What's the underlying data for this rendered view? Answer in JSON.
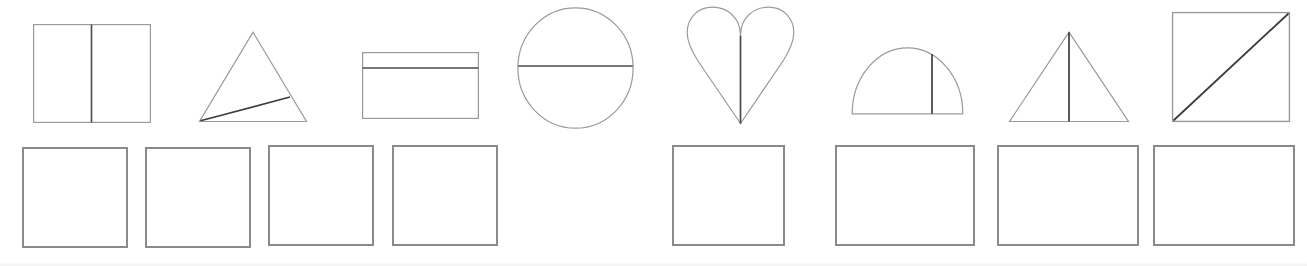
{
  "page": {
    "background_color": "#ffffff",
    "width": 1307,
    "height": 266,
    "outline_color": "#9a9a9a",
    "divider_color": "#4a4a4a",
    "answer_box_color": "#8a8a8a"
  },
  "rows": {
    "shapes_row": {
      "name": "shapes-row",
      "count": 8,
      "top": 0,
      "height": 135
    },
    "answers_row": {
      "name": "answer-boxes-row",
      "count": 8,
      "top": 140,
      "height": 120
    }
  },
  "shapes": [
    {
      "index": 1,
      "name": "square-split-vertical",
      "label": "square",
      "divider": "vertical-line",
      "equal_parts": "2",
      "x": 33,
      "y": 24,
      "width": 118,
      "height": 99
    },
    {
      "index": 2,
      "name": "triangle-split-diagonal",
      "label": "triangle",
      "divider": "diagonal-line",
      "equal_parts": "2",
      "x": 198,
      "y": 31,
      "width": 110,
      "height": 92
    },
    {
      "index": 3,
      "name": "rectangle-split-horizontal",
      "label": "rectangle",
      "divider": "horizontal-line",
      "equal_parts": "2",
      "x": 362,
      "y": 52,
      "width": 117,
      "height": 67
    },
    {
      "index": 4,
      "name": "circle-split-horizontal",
      "label": "circle",
      "divider": "horizontal-line",
      "equal_parts": "2",
      "x": 517,
      "y": 7,
      "width": 117,
      "height": 122
    },
    {
      "index": 5,
      "name": "heart-split-vertical",
      "label": "heart",
      "divider": "vertical-line",
      "equal_parts": "2",
      "x": 686,
      "y": 6,
      "width": 109,
      "height": 119
    },
    {
      "index": 6,
      "name": "semicircle-split-vertical",
      "label": "semicircle",
      "divider": "vertical-line",
      "equal_parts": "2",
      "x": 851,
      "y": 46,
      "width": 113,
      "height": 69
    },
    {
      "index": 7,
      "name": "triangle-split-vertical",
      "label": "triangle",
      "divider": "vertical-line",
      "equal_parts": "2",
      "x": 1008,
      "y": 31,
      "width": 122,
      "height": 92
    },
    {
      "index": 8,
      "name": "square-split-diagonal",
      "label": "square",
      "divider": "diagonal-line",
      "equal_parts": "2",
      "x": 1172,
      "y": 12,
      "width": 118,
      "height": 110
    }
  ],
  "answer_boxes": [
    {
      "index": 1,
      "name": "answer-box-1",
      "value": "",
      "x": 22,
      "y": 147,
      "width": 106,
      "height": 101
    },
    {
      "index": 2,
      "name": "answer-box-2",
      "value": "",
      "x": 145,
      "y": 147,
      "width": 106,
      "height": 101
    },
    {
      "index": 3,
      "name": "answer-box-3",
      "value": "",
      "x": 268,
      "y": 145,
      "width": 106,
      "height": 101
    },
    {
      "index": 4,
      "name": "answer-box-4",
      "value": "",
      "x": 392,
      "y": 145,
      "width": 106,
      "height": 101
    },
    {
      "index": 5,
      "name": "answer-box-5",
      "value": "",
      "x": 672,
      "y": 145,
      "width": 113,
      "height": 101
    },
    {
      "index": 6,
      "name": "answer-box-6",
      "value": "",
      "x": 835,
      "y": 145,
      "width": 140,
      "height": 101
    },
    {
      "index": 7,
      "name": "answer-box-7",
      "value": "",
      "x": 997,
      "y": 145,
      "width": 142,
      "height": 101
    },
    {
      "index": 8,
      "name": "answer-box-8",
      "value": "",
      "x": 1153,
      "y": 145,
      "width": 142,
      "height": 101
    }
  ]
}
